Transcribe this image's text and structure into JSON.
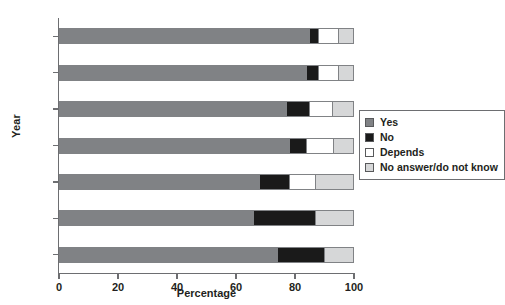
{
  "chart_data": {
    "type": "bar",
    "orientation": "horizontal",
    "stacked": true,
    "stacked_mode": "percent",
    "title": "",
    "xlabel": "Percentage",
    "ylabel": "Year",
    "xlim": [
      0,
      100
    ],
    "xticks": [
      0,
      20,
      40,
      60,
      80,
      100
    ],
    "xtick_labels": [
      "0",
      "20",
      "40",
      "60",
      "80",
      "100"
    ],
    "grid": false,
    "legend_position": "right-middle",
    "categories": [
      "2006",
      "2000",
      "1995",
      "1990",
      "1985",
      "1980",
      "1978"
    ],
    "series": [
      {
        "name": "Yes",
        "color": "#808285",
        "values": [
          85,
          84,
          77,
          78,
          68,
          66,
          74
        ]
      },
      {
        "name": "No",
        "color": "#1a1a1a",
        "values": [
          3,
          4,
          8,
          6,
          10,
          21,
          16
        ]
      },
      {
        "name": "Depends",
        "color": "#ffffff",
        "values": [
          7,
          7,
          8,
          9,
          9,
          0,
          0
        ]
      },
      {
        "name": "No answer/do not know",
        "color": "#d6d7d8",
        "values": [
          5,
          5,
          7,
          7,
          13,
          13,
          10
        ]
      }
    ]
  },
  "axes": {
    "y_title": "Year",
    "x_title": "Percentage"
  },
  "legend": {
    "items": [
      {
        "label": "Yes",
        "color": "#808285"
      },
      {
        "label": "No",
        "color": "#1a1a1a"
      },
      {
        "label": "Depends",
        "color": "#ffffff"
      },
      {
        "label": "No answer/do not know",
        "color": "#d6d7d8"
      }
    ]
  },
  "colors": {
    "axis": "#6d6e71",
    "bar_border": "#808285",
    "text": "#231f20"
  }
}
